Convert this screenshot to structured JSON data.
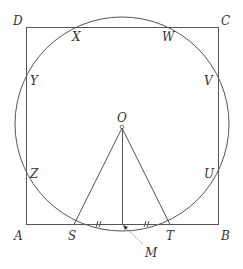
{
  "diagram": {
    "type": "geometry",
    "colors": {
      "line": "#555555",
      "label": "#333333",
      "background": "#ffffff"
    },
    "square": {
      "vertices": [
        "A",
        "B",
        "C",
        "D"
      ]
    },
    "circle": {
      "center": "O"
    },
    "labels": {
      "A": "A",
      "B": "B",
      "C": "C",
      "D": "D",
      "X": "X",
      "W": "W",
      "Y": "Y",
      "V": "V",
      "Z": "Z",
      "U": "U",
      "O": "O",
      "S": "S",
      "T": "T",
      "M": "M"
    },
    "tick_marks": {
      "SM": "//",
      "MT": "//"
    },
    "segments": [
      "OS",
      "OT",
      "OM"
    ],
    "intersections": {
      "top_side_DC": [
        "X",
        "W"
      ],
      "left_side_DA": [
        "Y",
        "Z"
      ],
      "right_side_CB": [
        "V",
        "U"
      ],
      "bottom_side_AB": [
        "S",
        "T"
      ]
    }
  }
}
